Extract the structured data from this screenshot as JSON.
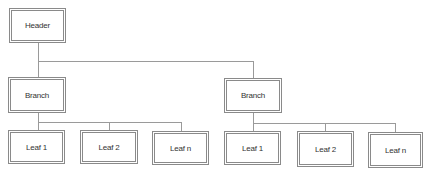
{
  "diagram": {
    "type": "hierarchy-tree",
    "root": {
      "label": "Header"
    },
    "branches": [
      {
        "label": "Branch",
        "leaves": [
          {
            "label": "Leaf 1"
          },
          {
            "label": "Leaf 2"
          },
          {
            "label": "Leaf n"
          }
        ]
      },
      {
        "label": "Branch",
        "leaves": [
          {
            "label": "Leaf 1"
          },
          {
            "label": "Leaf 2"
          },
          {
            "label": "Leaf n"
          }
        ]
      }
    ]
  },
  "colors": {
    "border": "#8a8a8a",
    "connector": "#9a9a9a",
    "text": "#333333",
    "background": "#ffffff"
  }
}
